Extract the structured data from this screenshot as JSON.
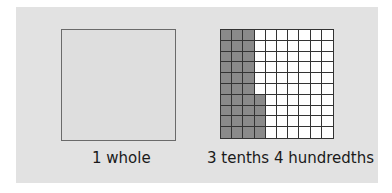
{
  "diagram": {
    "whole": {
      "label": "1 whole"
    },
    "hundredths_grid": {
      "label": "3 tenths 4 hundredths",
      "rows": 10,
      "cols": 10,
      "shaded_full_columns": 3,
      "shaded_extra_cells": 4,
      "shaded_color": "#8a8a8a",
      "unshaded_color": "#ffffff"
    },
    "panel_color": "#e2e2e2"
  }
}
